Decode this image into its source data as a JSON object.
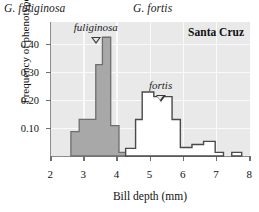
{
  "figure": {
    "species_left": "G. fuliginosa",
    "species_right": "G. fortis",
    "site_label": "Santa Cruz"
  },
  "axes": {
    "ylabel": "Frequency of phenotype",
    "xlabel": "Bill depth (mm)",
    "yticks": [
      "0.10",
      "0.20",
      "0.30",
      "0.40"
    ],
    "xticks": [
      "2",
      "3",
      "4",
      "5",
      "6",
      "7",
      "8"
    ]
  },
  "annotations": {
    "fuliginosa_marker": "fuliginosa",
    "fortis_marker": "fortis"
  },
  "colors": {
    "fill_fuliginosa": "#a8a8a8",
    "stroke_fuliginosa": "#6e6e6e",
    "fill_fortis": "#ffffff",
    "stroke_fortis": "#4a4a4a",
    "plot_background": "#e9e9e9",
    "gridline": "#fafafa",
    "axis": "#8c8c8c"
  },
  "chart_data": {
    "type": "bar",
    "title": "",
    "subtitle": "Santa Cruz",
    "xlabel": "Bill depth (mm)",
    "ylabel": "Frequency of phenotype",
    "xlim": [
      2,
      8
    ],
    "ylim": [
      0,
      0.44
    ],
    "yticks": [
      0.1,
      0.2,
      0.3,
      0.4
    ],
    "xticks": [
      2,
      3,
      4,
      5,
      6,
      7,
      8
    ],
    "grid": true,
    "legend": "none",
    "bin_width": 0.25,
    "series": [
      {
        "name": "G. fuliginosa",
        "style": "filled-gray",
        "bins": [
          {
            "x0": 2.6,
            "x1": 2.85,
            "value": 0.08
          },
          {
            "x0": 2.85,
            "x1": 3.1,
            "value": 0.12
          },
          {
            "x0": 3.1,
            "x1": 3.35,
            "value": 0.12
          },
          {
            "x0": 3.35,
            "x1": 3.55,
            "value": 0.3
          },
          {
            "x0": 3.55,
            "x1": 3.8,
            "value": 0.39
          },
          {
            "x0": 3.8,
            "x1": 4.05,
            "value": 0.1
          },
          {
            "x0": 4.05,
            "x1": 4.3,
            "value": 0.012
          }
        ],
        "peak_value": 0.39,
        "peak_bin": [
          3.55,
          3.8
        ],
        "marker_x": 3.35
      },
      {
        "name": "G. fortis",
        "style": "outline-white",
        "bins": [
          {
            "x0": 4.25,
            "x1": 4.55,
            "value": 0.025
          },
          {
            "x0": 4.55,
            "x1": 4.75,
            "value": 0.12
          },
          {
            "x0": 4.75,
            "x1": 5.1,
            "value": 0.21
          },
          {
            "x0": 5.1,
            "x1": 5.35,
            "value": 0.195
          },
          {
            "x0": 5.35,
            "x1": 5.65,
            "value": 0.195
          },
          {
            "x0": 5.65,
            "x1": 5.9,
            "value": 0.12
          },
          {
            "x0": 5.9,
            "x1": 6.25,
            "value": 0.028
          },
          {
            "x0": 6.25,
            "x1": 6.6,
            "value": 0.038
          },
          {
            "x0": 6.6,
            "x1": 6.95,
            "value": 0.048
          },
          {
            "x0": 6.95,
            "x1": 7.2,
            "value": 0.012
          },
          {
            "x0": 7.45,
            "x1": 7.75,
            "value": 0.012
          }
        ],
        "peak_value": 0.21,
        "peak_bin": [
          4.75,
          5.1
        ],
        "marker_x": 5.3
      }
    ]
  }
}
